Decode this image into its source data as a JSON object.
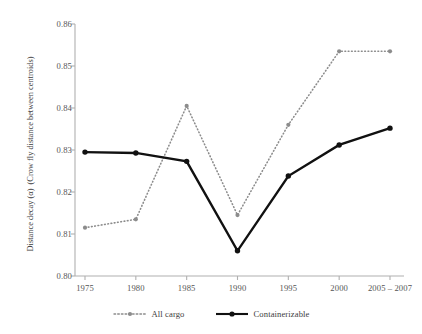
{
  "chart_data": {
    "type": "line",
    "title": "",
    "xlabel": "",
    "ylabel_line1": "Distance decay (α)",
    "ylabel_line2": "(Crow fly distance between centroids)",
    "categories": [
      "1975",
      "1980",
      "1985",
      "1990",
      "1995",
      "2000",
      "2005 – 2007"
    ],
    "ylim": [
      0.8,
      0.86
    ],
    "ytick_values": [
      0.8,
      0.81,
      0.82,
      0.83,
      0.84,
      0.85,
      0.86
    ],
    "ytick_labels": [
      "0.80",
      "0.81",
      "0.82",
      "0.83",
      "0.84",
      "0.85",
      "0.86"
    ],
    "grid": false,
    "legend_position": "bottom",
    "series": [
      {
        "name": "All cargo",
        "style": "dotted",
        "color": "#8c8c8c",
        "marker": "circle",
        "values": [
          0.8115,
          0.8135,
          0.8405,
          0.8145,
          0.836,
          0.8535,
          0.8535
        ]
      },
      {
        "name": "Containerizable",
        "style": "solid",
        "color": "#111111",
        "marker": "circle",
        "values": [
          0.8295,
          0.8293,
          0.8273,
          0.806,
          0.8238,
          0.8312,
          0.8352
        ]
      }
    ]
  },
  "legend": {
    "items": [
      {
        "label": "All cargo"
      },
      {
        "label": "Containerizable"
      }
    ]
  },
  "axes": {
    "axis_color": "#b0b0b0",
    "tick_color": "#b0b0b0"
  }
}
